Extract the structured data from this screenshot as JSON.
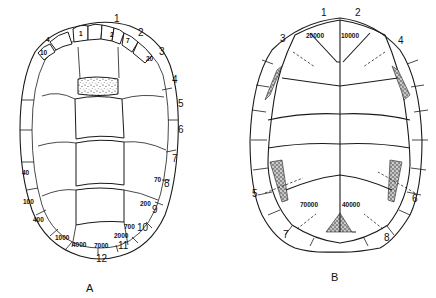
{
  "figure": {
    "panels": [
      {
        "id": "A",
        "caption": "A",
        "subject": "turtle carapace (dorsal shell)",
        "marginal_scute_labels": [
          "1",
          "2",
          "3",
          "4",
          "5",
          "6",
          "7",
          "8",
          "9",
          "10",
          "11",
          "12"
        ],
        "inner_values": {
          "top_left_a": "4",
          "top_left_b": "1",
          "top_right_a": "2",
          "top_right_b": "7",
          "top_right_c": "20",
          "left_top": "10",
          "left_mid": "40",
          "left_low": "100",
          "left_lower": "400",
          "bottom_left": "1000",
          "bottom_mid_left": "4000",
          "bottom_mid_right": "7000",
          "right_lower_a": "2000",
          "right_lower_b": "700",
          "right_mid": "200",
          "right_upper": "70"
        }
      },
      {
        "id": "B",
        "caption": "B",
        "subject": "turtle plastron (ventral shell)",
        "scute_labels": [
          "1",
          "2",
          "3",
          "4",
          "5",
          "6",
          "7",
          "8"
        ],
        "inner_values": {
          "upper_left": "20000",
          "upper_right": "10000",
          "lower_left": "70000",
          "lower_right": "40000"
        }
      }
    ]
  }
}
